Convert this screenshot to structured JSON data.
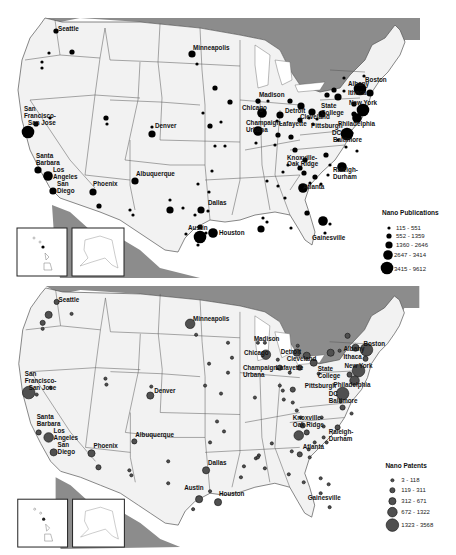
{
  "figure": {
    "panels": [
      {
        "id": "publications",
        "legend": {
          "title": "Nano Publications",
          "classes": [
            {
              "label": "115 - 551",
              "r": 1.6
            },
            {
              "label": "552 - 1359",
              "r": 2.6
            },
            {
              "label": "1360 - 2646",
              "r": 3.6
            },
            {
              "label": "2647 - 3414",
              "r": 4.8
            },
            {
              "label": "3415 - 9612",
              "r": 6.3
            }
          ],
          "symbol_fill": "#000000"
        }
      },
      {
        "id": "patents",
        "legend": {
          "title": "Nano Patents",
          "classes": [
            {
              "label": "3 - 118",
              "r": 1.6
            },
            {
              "label": "119 - 311",
              "r": 2.6
            },
            {
              "label": "312 - 671",
              "r": 3.6
            },
            {
              "label": "672 - 1322",
              "r": 4.8
            },
            {
              "label": "1323 - 3568",
              "r": 6.3
            }
          ],
          "symbol_fill": "#505050"
        }
      }
    ],
    "city_labels": [
      "Seattle",
      "San Francisco-San Jose",
      "Santa Barbara",
      "Los Angeles",
      "San Diego",
      "Phoenix",
      "Albuquerque",
      "Denver",
      "Dallas",
      "Austin",
      "Houston",
      "Minneapolis",
      "Madison",
      "Chicago",
      "Detroit",
      "Cleveland",
      "Champaign-Urbana",
      "Lafayette",
      "State College",
      "Pittsburgh",
      "Albany",
      "Boston",
      "Ithaca",
      "New York",
      "Philadelphia",
      "DC",
      "Baltimore",
      "Knoxville-Oak Ridge",
      "Raleigh-Durham",
      "Atlanta",
      "Gainesville"
    ],
    "colors": {
      "land": "#f2f2f2",
      "water_neighbor": "#8c8c8c",
      "borders": "#555555",
      "background": "#ffffff"
    }
  },
  "labels": {
    "seattle": "Seattle",
    "san": "San",
    "francisco": "Francisco-",
    "sanjose": "San Jose",
    "santa": "Santa",
    "barbara": "Barbara",
    "los": "Los",
    "angeles": "Angeles",
    "san2": "San",
    "diego": "Diego",
    "phoenix": "Phoenix",
    "albuquerque": "Albuquerque",
    "denver": "Denver",
    "dallas": "Dallas",
    "austin": "Austin",
    "houston": "Houston",
    "minneapolis": "Minneapolis",
    "madison": "Madison",
    "chicago": "Chicago",
    "detroit": "Detroit",
    "cleveland": "Cleveland",
    "champaign": "Champaign-",
    "urbana": "Urbana",
    "lafayette": "Lafayette",
    "state": "State",
    "college": "College",
    "pittsburgh": "Pittsburgh",
    "albany": "Albany",
    "boston": "Boston",
    "ithaca": "Ithaca",
    "newyork": "New York",
    "philadelphia": "Philadelphia",
    "dc": "DC",
    "baltimore": "Baltimore",
    "knoxville": "Knoxville-",
    "oakridge": "Oak Ridge",
    "raleigh": "Raleigh-",
    "durham": "Durham",
    "atlanta": "Atlanta",
    "gainesville": "Gainesville"
  },
  "legend_pub": {
    "title": "Nano Publications",
    "c1": "115 - 551",
    "c2": "552 - 1359",
    "c3": "1360 - 2646",
    "c4": "2647 - 3414",
    "c5": "3415 - 9612"
  },
  "legend_pat": {
    "title": "Nano Patents",
    "c1": "3 - 118",
    "c2": "119 - 311",
    "c3": "312 - 671",
    "c4": "672 - 1322",
    "c5": "1323 - 3568"
  }
}
